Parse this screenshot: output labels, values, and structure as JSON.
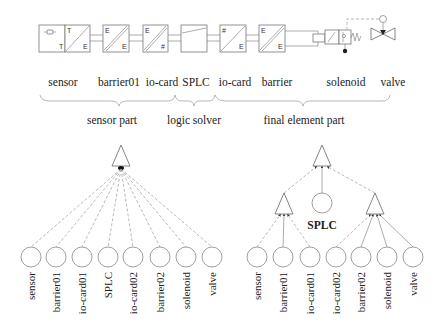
{
  "diagram": {
    "block_row": {
      "blocks": [
        {
          "name": "sensor",
          "corner_tl": "",
          "corner_br": "T",
          "symbol": "sensor-element"
        },
        {
          "name": "barrier01",
          "corner_tl": "T",
          "corner_br": "E",
          "symbol": "diagonal"
        },
        {
          "name": "io-card",
          "corner_tl": "E",
          "corner_br": "E",
          "symbol": "double-diagonal"
        },
        {
          "name": "io-card-in",
          "corner_tl": "E",
          "corner_br": "#",
          "symbol": "double-diagonal"
        },
        {
          "name": "SPLC",
          "corner_tl": "",
          "corner_br": "",
          "symbol": "slope"
        },
        {
          "name": "io-card-out",
          "corner_tl": "#",
          "corner_br": "E",
          "symbol": "diagonal"
        },
        {
          "name": "barrier",
          "corner_tl": "E",
          "corner_br": "E",
          "symbol": "double-diagonal"
        },
        {
          "name": "solenoid",
          "corner_tl": "",
          "corner_br": "",
          "symbol": "solenoid-valve"
        },
        {
          "name": "valve",
          "corner_tl": "",
          "corner_br": "",
          "symbol": "actuated-valve"
        }
      ]
    },
    "component_labels": [
      "sensor",
      "barrier01",
      "io-card",
      "SPLC",
      "io-card",
      "barrier",
      "solenoid",
      "valve"
    ],
    "groups": [
      {
        "label": "sensor part"
      },
      {
        "label": "logic solver"
      },
      {
        "label": "final element part"
      }
    ],
    "left_tree": {
      "type": "single-gate",
      "leaves": [
        "sensor",
        "barrier01",
        "io-card01",
        "SPLC",
        "io-card02",
        "barrier02",
        "solenoid",
        "valve"
      ]
    },
    "right_tree": {
      "type": "hierarchical",
      "middle_node": "SPLC",
      "left_subgate_leaves": [
        "sensor",
        "barrier01",
        "io-card01"
      ],
      "right_subgate_leaves": [
        "io-card02",
        "barrier02",
        "solenoid",
        "valve"
      ],
      "leaves": [
        "sensor",
        "barrier01",
        "io-card01",
        "io-card02",
        "barrier02",
        "solenoid",
        "valve"
      ]
    }
  }
}
